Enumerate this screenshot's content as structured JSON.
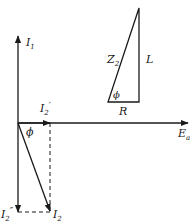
{
  "diagram": {
    "type": "phasor-diagram",
    "colors": {
      "line": "#1a1a1a",
      "background": "#ffffff"
    },
    "phasor_labels": {
      "i1": {
        "main": "I",
        "sub": "1",
        "prime": ""
      },
      "i2_prime": {
        "main": "I",
        "sub": "2",
        "prime": "′"
      },
      "i2_double_prime": {
        "main": "I",
        "sub": "2",
        "prime": "″"
      },
      "i2": {
        "main": "I",
        "sub": "2",
        "prime": ""
      },
      "ea": {
        "main": "E",
        "sub": "a"
      },
      "phi": "ϕ"
    },
    "impedance_triangle": {
      "hypotenuse": {
        "main": "Z",
        "sub": "2"
      },
      "vertical": "L",
      "horizontal": "R",
      "angle": "ϕ"
    }
  }
}
